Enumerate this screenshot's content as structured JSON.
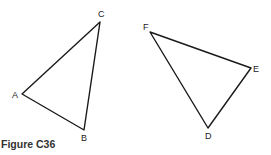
{
  "figure": {
    "caption": "Figure C36",
    "triangles": [
      {
        "name": "ABC",
        "vertices": [
          "A",
          "B",
          "C"
        ]
      },
      {
        "name": "DEF",
        "vertices": [
          "D",
          "E",
          "F"
        ]
      }
    ],
    "labels": {
      "A": "A",
      "B": "B",
      "C": "C",
      "D": "D",
      "E": "E",
      "F": "F"
    }
  }
}
